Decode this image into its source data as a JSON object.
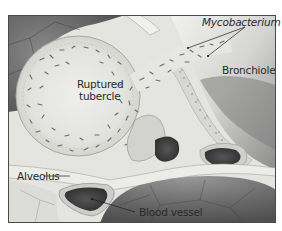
{
  "figure": {
    "labels": {
      "mycobacterium": "Mycobacterium",
      "ruptured_tubercle_line1": "Ruptured",
      "ruptured_tubercle_line2": "tubercle",
      "bronchiole": "Bronchiole",
      "alveolus": "Alveolus",
      "blood_vessel": "Blood vessel"
    },
    "colors": {
      "frame": "#4a4a4a",
      "tissue_light": "#e9e9e6",
      "tissue_mid": "#c9c9c6",
      "tissue_dark": "#6e6e6e",
      "alveolus_dark": "#5a5a5a",
      "vessel_dark": "#3d3d3d",
      "bacteria": "#6a6a6a",
      "text": "#2a2a2a"
    }
  }
}
